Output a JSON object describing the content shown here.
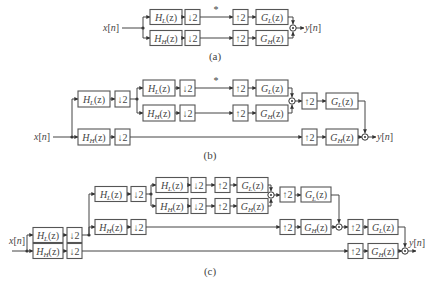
{
  "figure": {
    "type": "filter-bank block diagrams",
    "input_label": "x[n]",
    "output_label": "y[n]",
    "blocks": {
      "analysis_low": {
        "name": "H",
        "sub": "L",
        "arg": "(z)"
      },
      "analysis_high": {
        "name": "H",
        "sub": "H",
        "arg": "(z)"
      },
      "synthesis_low": {
        "name": "G",
        "sub": "L",
        "arg": "(z)"
      },
      "synthesis_high": {
        "name": "G",
        "sub": "H",
        "arg": "(z)"
      },
      "downsample": "↓2",
      "upsample": "↑2"
    },
    "marker": "*",
    "subfigures": [
      {
        "caption": "(a)",
        "levels": 1
      },
      {
        "caption": "(b)",
        "levels": 2
      },
      {
        "caption": "(c)",
        "levels": 3
      }
    ]
  }
}
